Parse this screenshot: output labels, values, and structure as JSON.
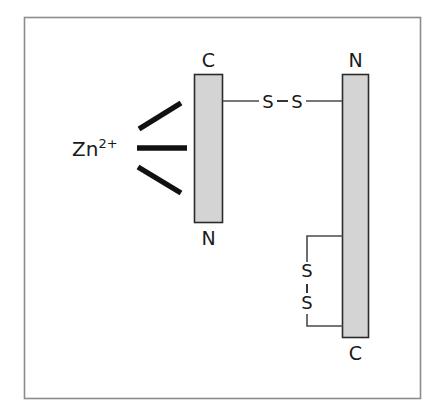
{
  "figure": {
    "frame": {
      "border_color": "#8c8c8c",
      "background": "#ffffff"
    },
    "colors": {
      "helix_fill": "#d4d4d4",
      "helix_stroke": "#2b2b2b",
      "bond_line": "#4a4a4a",
      "zinc_bond": "#111111",
      "text": "#1a1a1a"
    },
    "helices": [
      {
        "id": "helix-left",
        "top_label": "C",
        "bottom_label": "N",
        "x": 194,
        "y": 74,
        "width": 28,
        "height": 148
      },
      {
        "id": "helix-right",
        "top_label": "N",
        "bottom_label": "C",
        "x": 342,
        "y": 74,
        "width": 26,
        "height": 263
      }
    ],
    "zinc": {
      "label_main": "Zn",
      "label_superscript": "2+",
      "bond_count": 3,
      "bonds": [
        {
          "id": "zinc-bond-upper",
          "x1": 139,
          "y1": 129,
          "x2": 181,
          "y2": 103
        },
        {
          "id": "zinc-bond-middle",
          "x1": 137,
          "y1": 148,
          "x2": 187,
          "y2": 148
        },
        {
          "id": "zinc-bond-lower",
          "x1": 138,
          "y1": 167,
          "x2": 181,
          "y2": 193
        }
      ]
    },
    "disulfide_interchain": {
      "id": "disulfide-horizontal",
      "sulfur_left": "S",
      "sulfur_right": "S",
      "orientation": "horizontal",
      "y": 101
    },
    "disulfide_intrachain": {
      "id": "disulfide-vertical",
      "sulfur_top": "S",
      "sulfur_bottom": "S",
      "orientation": "vertical",
      "bracket_x": 307,
      "bracket_top_y": 236,
      "bracket_bottom_y": 326
    }
  }
}
